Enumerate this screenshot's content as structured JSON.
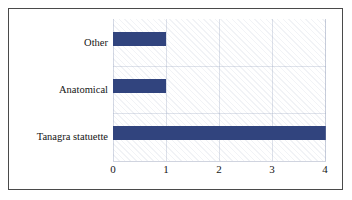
{
  "chart_data": {
    "type": "bar",
    "orientation": "horizontal",
    "title": "",
    "subtitle": "",
    "xlabel": "",
    "ylabel": "",
    "categories": [
      "Tanagra statuette",
      "Anatomical",
      "Other"
    ],
    "values": [
      4,
      1,
      1
    ],
    "series": [
      {
        "name": "Count",
        "values": [
          4,
          1,
          1
        ],
        "color": "#31447E"
      }
    ],
    "xlim": [
      0,
      4
    ],
    "xticks": [
      0,
      1,
      2,
      3,
      4
    ],
    "xtick_labels": [
      "0",
      "1",
      "2",
      "3",
      "4"
    ],
    "grid": true,
    "grid_axis": "both",
    "legend": false,
    "legend_position": "none",
    "plot_background": "hatched-light-diagonal",
    "frame": true
  },
  "colors": {
    "bar": "#31447E",
    "frame": "#4a4a4a",
    "grid": "#96a2be",
    "text": "#151515",
    "background": "#ffffff"
  }
}
